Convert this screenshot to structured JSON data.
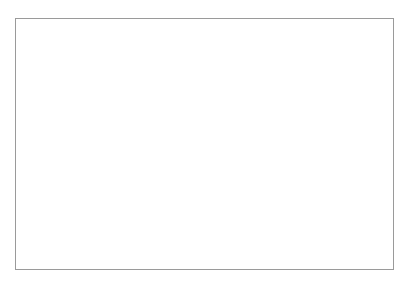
{
  "chart_data": {
    "type": "line",
    "title": "",
    "xlabel": "Jahr",
    "ylabel": "Mio. USD (in 1978er Preisen)",
    "x": [
      "1953",
      "1956",
      "1960",
      "1964",
      "1968",
      "1972",
      "1976",
      "1980",
      "1984",
      "1988"
    ],
    "categories": [
      "1953",
      "1956",
      "1960",
      "1964",
      "1968",
      "1972",
      "1976",
      "1980",
      "1984",
      "1988"
    ],
    "ylim": [
      0,
      50000
    ],
    "ytick_labels": [
      "0",
      "5000",
      "10000",
      "15000",
      "20000",
      "25000",
      "30000",
      "35000",
      "40000",
      "45000",
      "50000"
    ],
    "ytick_values": [
      0,
      5000,
      10000,
      15000,
      20000,
      25000,
      30000,
      35000,
      40000,
      45000,
      50000
    ],
    "grid": true,
    "legend_position": "right",
    "series": [
      {
        "name": "Mittlerer Osten",
        "marker": "filled-diamond",
        "values": [
          1200,
          1500,
          1800,
          2200,
          3200,
          5500,
          31000,
          32000,
          46000,
          28000
        ]
      },
      {
        "name": "Ferner Osten (ohne China)",
        "marker": "filled-square",
        "values": [
          2600,
          3200,
          4700,
          6100,
          8200,
          11900,
          13500,
          17500,
          24700,
          29000
        ]
      },
      {
        "name": "Afrika (ohne Ägypten)",
        "marker": "open-triangle",
        "values": [
          600,
          900,
          1300,
          1900,
          2800,
          4400,
          5200,
          10800,
          7500,
          6900
        ]
      },
      {
        "name": "Südasien",
        "marker": "cross",
        "values": [
          1700,
          2000,
          2400,
          2900,
          3700,
          4700,
          5000,
          5200,
          5500,
          6800
        ]
      },
      {
        "name": "Lateinamerika",
        "marker": "open-circle",
        "values": [
          1000,
          1400,
          2500,
          3400,
          5100,
          8000,
          18000,
          25500,
          22500,
          20000
        ]
      }
    ]
  }
}
